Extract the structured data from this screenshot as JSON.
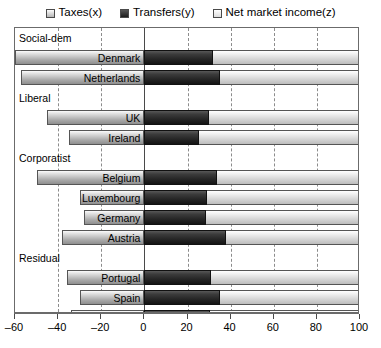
{
  "chart_data": {
    "type": "bar",
    "orientation": "horizontal",
    "stacked": true,
    "title": "",
    "xlabel": "",
    "ylabel": "",
    "xlim": [
      -60,
      100
    ],
    "xticks": [
      -60,
      -40,
      -20,
      0,
      20,
      40,
      60,
      80,
      100
    ],
    "xticklabels": [
      "–60",
      "–40",
      "–20",
      "0",
      "20",
      "40",
      "60",
      "80",
      "100"
    ],
    "grid": true,
    "legend_position": "top-center",
    "legend": [
      {
        "label": "Taxes(x)",
        "key": "taxes",
        "swatch": "light-gradient"
      },
      {
        "label": "Transfers(y)",
        "key": "transfers",
        "swatch": "dark"
      },
      {
        "label": "Net market income(z)",
        "key": "net",
        "swatch": "white"
      }
    ],
    "groups": [
      {
        "label": "Social-dem",
        "countries": [
          {
            "name": "Denmark",
            "taxes": -60,
            "transfers": 32,
            "net": 100
          },
          {
            "name": "Netherlands",
            "taxes": -57,
            "transfers": 35,
            "net": 100
          }
        ]
      },
      {
        "label": "Liberal",
        "countries": [
          {
            "name": "UK",
            "taxes": -45,
            "transfers": 30,
            "net": 100
          },
          {
            "name": "Ireland",
            "taxes": -35,
            "transfers": 25.5,
            "net": 100
          }
        ]
      },
      {
        "label": "Corporatist",
        "countries": [
          {
            "name": "Belgium",
            "taxes": -50,
            "transfers": 33.5,
            "net": 100
          },
          {
            "name": "Luxembourg",
            "taxes": -30,
            "transfers": 29,
            "net": 100
          },
          {
            "name": "Germany",
            "taxes": -28,
            "transfers": 28.5,
            "net": 100
          },
          {
            "name": "Austria",
            "taxes": -38,
            "transfers": 38,
            "net": 100
          }
        ]
      },
      {
        "label": "Residual",
        "countries": [
          {
            "name": "Portugal",
            "taxes": -36,
            "transfers": 31,
            "net": 100
          },
          {
            "name": "Spain",
            "taxes": -30,
            "transfers": 35,
            "net": 100
          },
          {
            "name": "Italy",
            "taxes": -34,
            "transfers": 30.5,
            "net": 100
          },
          {
            "name": "Greece",
            "taxes": -24,
            "transfers": 30,
            "net": 100
          }
        ]
      }
    ]
  },
  "colors": {
    "taxes": "#b6b6b6",
    "transfers": "#222222",
    "net": "#dcdcdc",
    "frame": "#6b6b6b",
    "grid": "#8c8c8c",
    "text": "#000000"
  }
}
